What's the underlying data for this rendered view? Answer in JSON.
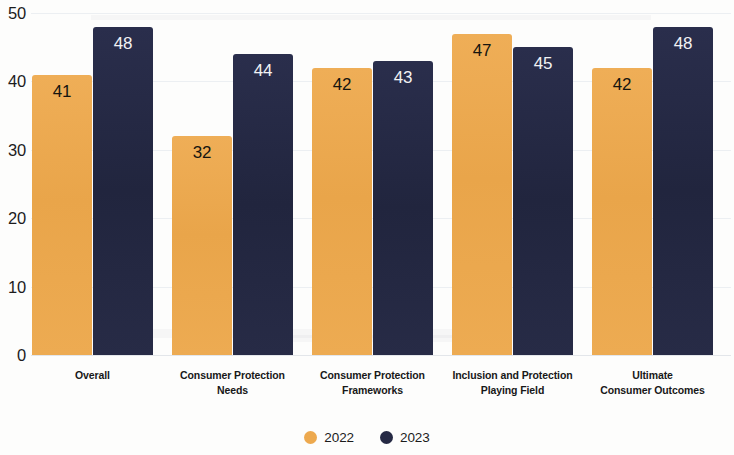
{
  "chart_data": {
    "type": "bar",
    "title": "",
    "subtitle": "",
    "xlabel": "",
    "ylabel": "",
    "ylim": [
      0,
      50
    ],
    "yticks": [
      0,
      10,
      20,
      30,
      40,
      50
    ],
    "grid": true,
    "legend_position": "bottom",
    "categories": [
      "Overall",
      "Consumer Protection Needs",
      "Consumer Protection Frameworks",
      "Inclusion and Protection Playing Field",
      "Ultimate Consumer Outcomes"
    ],
    "category_lines": [
      [
        "Overall"
      ],
      [
        "Consumer Protection",
        "Needs"
      ],
      [
        "Consumer Protection",
        "Frameworks"
      ],
      [
        "Inclusion and Protection",
        "Playing Field"
      ],
      [
        "Ultimate",
        "Consumer Outcomes"
      ]
    ],
    "series": [
      {
        "name": "2022",
        "color": "#eda94e",
        "values": [
          41,
          32,
          42,
          47,
          42
        ]
      },
      {
        "name": "2023",
        "color": "#252944",
        "values": [
          48,
          44,
          43,
          45,
          48
        ]
      }
    ]
  },
  "legend": {
    "items": [
      {
        "label": "2022",
        "color": "#eda94e"
      },
      {
        "label": "2023",
        "color": "#252944"
      }
    ]
  },
  "axis": {
    "y_tick_labels": [
      "50",
      "40",
      "30",
      "20",
      "10",
      "0"
    ]
  }
}
